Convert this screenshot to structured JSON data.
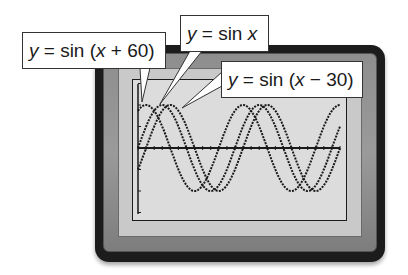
{
  "labels": [
    {
      "id": "shift-left",
      "pre": "y",
      "eq": " = sin (",
      "var": "x",
      "post": " + 60)"
    },
    {
      "id": "base",
      "pre": "y",
      "eq": " = sin ",
      "var": "x",
      "post": ""
    },
    {
      "id": "shift-right",
      "pre": "y",
      "eq": " = sin (",
      "var": "x",
      "post": " − 30)"
    }
  ],
  "colors": {
    "frame_outer": "#1c1c1c",
    "frame_mid": "#8e8e8e",
    "screen": "#dcdcdc",
    "curve": "#1a1a1a"
  },
  "chart_data": {
    "type": "line",
    "title": "",
    "xlabel": "",
    "ylabel": "",
    "xlim": [
      0,
      750
    ],
    "ylim": [
      -1.5,
      1.5
    ],
    "grid": false,
    "legend": "callout labels",
    "x_tick_step": 30,
    "series": [
      {
        "name": "y = sin (x + 60)",
        "function": "sin(x+60)",
        "phase_shift": -60
      },
      {
        "name": "y = sin x",
        "function": "sin(x)",
        "phase_shift": 0
      },
      {
        "name": "y = sin (x − 30)",
        "function": "sin(x-30)",
        "phase_shift": 30
      }
    ],
    "x": [
      0,
      30,
      60,
      90,
      120,
      150,
      180,
      210,
      240,
      270,
      300,
      330,
      360,
      390,
      420,
      450,
      480,
      510,
      540,
      570,
      600,
      630,
      660,
      690,
      720
    ],
    "values": {
      "sin(x+60)": [
        0.87,
        1.0,
        0.87,
        0.5,
        0.0,
        -0.5,
        -0.87,
        -1.0,
        -0.87,
        -0.5,
        0.0,
        0.5,
        0.87,
        1.0,
        0.87,
        0.5,
        0.0,
        -0.5,
        -0.87,
        -1.0,
        -0.87,
        -0.5,
        0.0,
        0.5,
        0.87
      ],
      "sin(x)": [
        0.0,
        0.5,
        0.87,
        1.0,
        0.87,
        0.5,
        0.0,
        -0.5,
        -0.87,
        -1.0,
        -0.87,
        -0.5,
        0.0,
        0.5,
        0.87,
        1.0,
        0.87,
        0.5,
        0.0,
        -0.5,
        -0.87,
        -1.0,
        -0.87,
        -0.5,
        0.0
      ],
      "sin(x-30)": [
        -0.5,
        0.0,
        0.5,
        0.87,
        1.0,
        0.87,
        0.5,
        0.0,
        -0.5,
        -0.87,
        -1.0,
        -0.87,
        -0.5,
        0.0,
        0.5,
        0.87,
        1.0,
        0.87,
        0.5,
        0.0,
        -0.5,
        -0.87,
        -1.0,
        -0.87,
        -0.5
      ]
    }
  }
}
